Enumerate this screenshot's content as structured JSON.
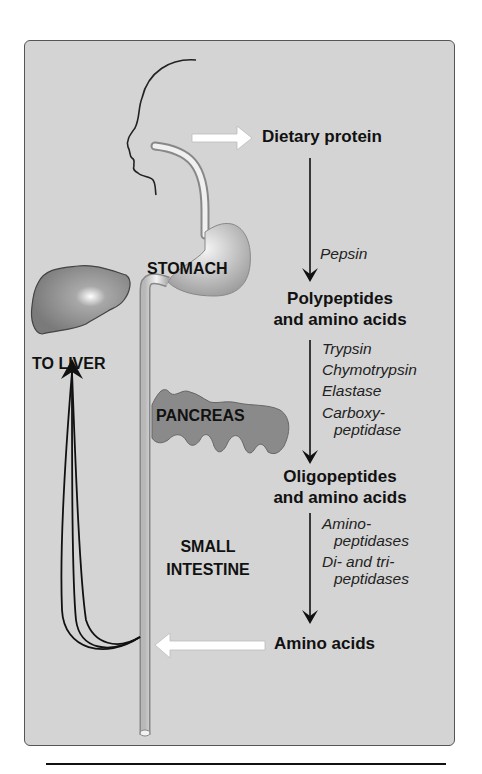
{
  "diagram": {
    "organs": {
      "stomach": "STOMACH",
      "to_liver": "TO LIVER",
      "pancreas": "PANCREAS",
      "small_intestine_line1": "SMALL",
      "small_intestine_line2": "INTESTINE"
    },
    "pathway": {
      "step1": "Dietary protein",
      "enzymes1": [
        "Pepsin"
      ],
      "step2_line1": "Polypeptides",
      "step2_line2": "and amino acids",
      "enzymes2": [
        "Trypsin",
        "Chymotrypsin",
        "Elastase",
        "Carboxy-",
        "peptidase"
      ],
      "step3_line1": "Oligopeptides",
      "step3_line2": "and amino acids",
      "enzymes3": [
        "Amino-",
        "peptidases",
        "Di- and tri-",
        "peptidases"
      ],
      "step4": "Amino acids"
    },
    "colors": {
      "panel_bg": "#d4d4d4",
      "organ_fill": "#8a8a8a",
      "text": "#111111",
      "arrow_white": "#ffffff"
    }
  }
}
